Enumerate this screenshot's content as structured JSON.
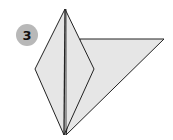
{
  "step": {
    "number": "3"
  },
  "colors": {
    "paper": "#e6e6e6",
    "line": "#222222",
    "badge": "#b8b8b8"
  },
  "diagram": {
    "shapes": [
      "kite",
      "triangle-flap"
    ]
  }
}
